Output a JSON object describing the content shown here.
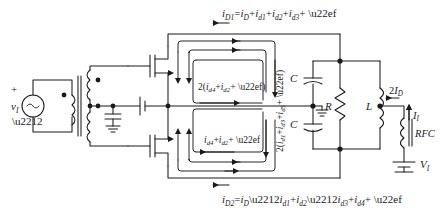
{
  "figure": {
    "type": "schematic",
    "stroke_color": "#1a1a1a",
    "background_color": "#ffffff"
  },
  "equations": {
    "top": {
      "label": "i_D1 = i_D + i_d1 + i_d2 + i_d3 + ···",
      "lhs": "i",
      "lhs_sub": "D1",
      "rhs_parts": [
        "i",
        "D",
        "+",
        "i",
        "d1",
        "+",
        "i",
        "d2",
        "+",
        "i",
        "d3",
        "+",
        "⋯"
      ],
      "arrow_direction": "left"
    },
    "bottom": {
      "label": "i_D2 = i_D − i_d1 + i_d2 − i_d3 + i_d4 + ···",
      "arrow_direction": "left"
    }
  },
  "loop_labels": {
    "even_upper": "2(i_d4 + i_d2 + ⋯)",
    "even_lower": "i_d4 + i_d2 + ⋯",
    "odd_vertical": "2(i_d1 + i_d3 + i_d5 + ⋯)"
  },
  "components": {
    "source": {
      "name": "v_i",
      "symbol": "ac-source",
      "plus": "+",
      "minus": "−"
    },
    "transformer": {
      "name": "input-transformer",
      "type": "center-tapped"
    },
    "bypass_cap": {
      "name": "bypass-capacitor"
    },
    "bias": {
      "name": "gate-bias-battery"
    },
    "q1": {
      "name": "mosfet-upper",
      "label": ""
    },
    "q2": {
      "name": "mosfet-lower",
      "label": ""
    },
    "c_top": {
      "label": "C"
    },
    "c_bottom": {
      "label": "C"
    },
    "resistor": {
      "label": "R"
    },
    "inductor": {
      "label": "L"
    },
    "rfc": {
      "label": "RFC"
    },
    "supply": {
      "label": "V_I",
      "main": "V",
      "sub": "I"
    },
    "drain_current": {
      "label": "2I_D",
      "main": "2I",
      "sub": "D",
      "arrow_direction": "left"
    },
    "input_current": {
      "label": "I_I",
      "main": "I",
      "sub": "I",
      "arrow_direction": "up"
    }
  }
}
